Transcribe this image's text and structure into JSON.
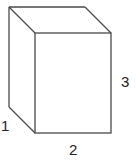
{
  "diagram": {
    "type": "rectangular-prism",
    "colors": {
      "edge": "#4a4a4a",
      "label": "#222222",
      "background": "#ffffff"
    },
    "dimensions": {
      "depth": {
        "label": "1",
        "edge": "bottom-left diagonal"
      },
      "width": {
        "label": "2",
        "edge": "front bottom"
      },
      "height": {
        "label": "3",
        "edge": "front right"
      }
    }
  }
}
